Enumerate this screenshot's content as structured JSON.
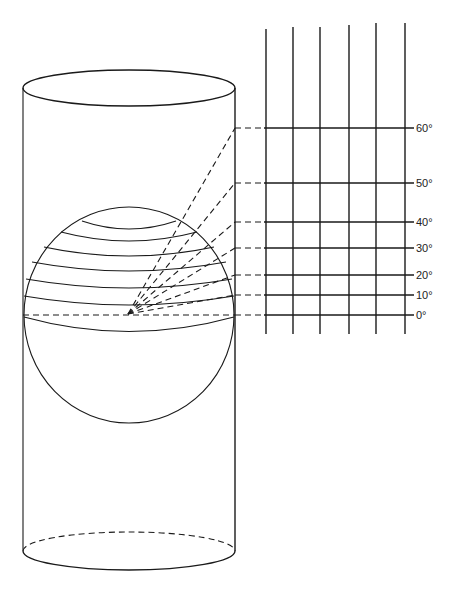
{
  "diagram": {
    "cylinder": {
      "left_x": 23,
      "right_x": 235,
      "top_ellipse": {
        "cx": 129,
        "cy": 88,
        "rx": 106,
        "ry": 18
      },
      "bottom_ellipse": {
        "cx": 129,
        "cy": 551,
        "rx": 106,
        "ry": 19
      }
    },
    "sphere": {
      "cx": 129,
      "cy": 315,
      "rx": 105,
      "ry": 108
    },
    "projection_origin": {
      "x": 128,
      "y": 314
    },
    "parallels": [
      {
        "lat": 60,
        "y_edge": 221,
        "x_edge": 176,
        "sag": 8,
        "grid_y": 128,
        "label": "60°"
      },
      {
        "lat": 50,
        "y_edge": 232,
        "x_edge": 197,
        "sag": 9,
        "grid_y": 183,
        "label": "50°"
      },
      {
        "lat": 40,
        "y_edge": 247,
        "x_edge": 214,
        "sag": 9,
        "grid_y": 222,
        "label": "40°"
      },
      {
        "lat": 30,
        "y_edge": 262,
        "x_edge": 226,
        "sag": 9,
        "grid_y": 248,
        "label": "30°"
      },
      {
        "lat": 20,
        "y_edge": 279,
        "x_edge": 232,
        "sag": 9,
        "grid_y": 275,
        "label": "20°"
      },
      {
        "lat": 10,
        "y_edge": 296,
        "x_edge": 234,
        "sag": 9,
        "grid_y": 295,
        "label": "10°"
      },
      {
        "lat": 0,
        "y_edge": 315,
        "x_edge": 235,
        "sag": 0,
        "grid_y": 315,
        "label": "0°"
      }
    ],
    "grid": {
      "meridian_x": [
        266,
        293,
        320,
        349,
        376,
        405
      ],
      "meridian_top_y": [
        29,
        27,
        27,
        25,
        23,
        23
      ],
      "meridian_bottom_y": 334,
      "line_start_x": 235,
      "dash_end_x": 264,
      "line_end_x": 414,
      "label_x": 416
    },
    "labels": [
      "60°",
      "50°",
      "40°",
      "30°",
      "20°",
      "10°",
      "0°"
    ]
  }
}
